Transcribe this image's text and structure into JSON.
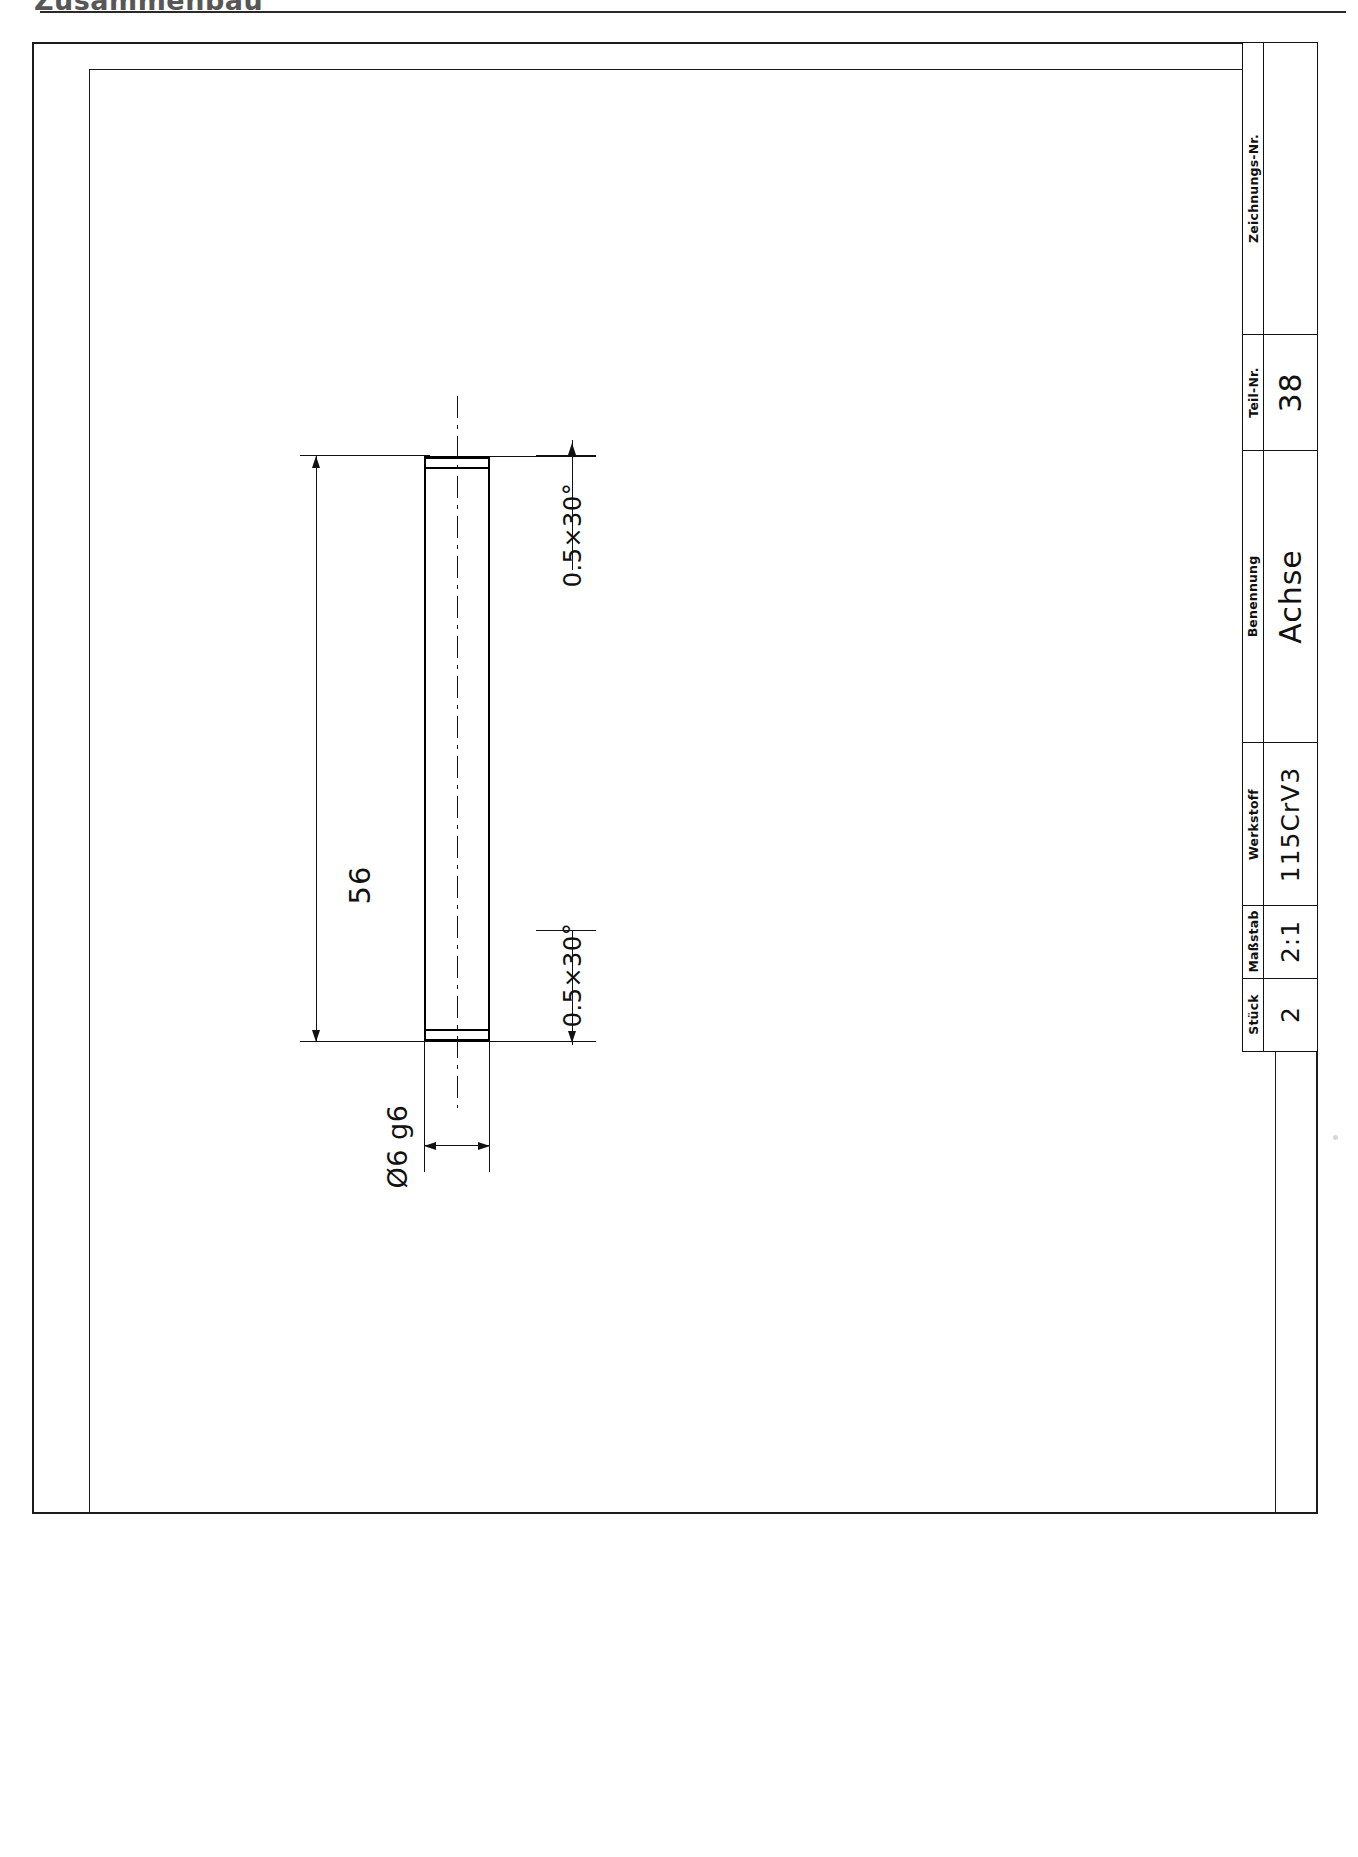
{
  "document": {
    "type": "technical-drawing",
    "language": "de",
    "header_text_clipped": "Zusammenbau",
    "sheet_background": "#ffffff",
    "line_color": "#111111"
  },
  "title_block": {
    "cells": [
      {
        "key": "zeichnungs_nr",
        "label": "Zeichnungs-Nr.",
        "value": ""
      },
      {
        "key": "teil_nr",
        "label": "Teil-Nr.",
        "value": "38"
      },
      {
        "key": "benennung",
        "label": "Benennung",
        "value": "Achse"
      },
      {
        "key": "werkstoff",
        "label": "Werkstoff",
        "value": "115CrV3"
      },
      {
        "key": "massstab",
        "label": "Maßstab",
        "value": "2:1"
      },
      {
        "key": "stueck",
        "label": "Stück",
        "value": "2"
      }
    ]
  },
  "drawing": {
    "part_name": "Achse",
    "view": "front-elevation",
    "dimensions": {
      "length": {
        "value": "56",
        "unit": "mm"
      },
      "diameter": {
        "symbol": "Ø",
        "value": "6",
        "tolerance": "g6",
        "display": "Ø6 g6"
      },
      "chamfer_top": "0.5×30°",
      "chamfer_bottom": "0.5×30°"
    }
  }
}
